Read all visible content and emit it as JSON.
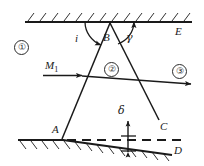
{
  "figure": {
    "width": 204,
    "height": 166,
    "background": "#ffffff",
    "stroke_color": "#1a1a1a",
    "label_color": "#1a1a1a"
  },
  "labels": {
    "region_1": "①",
    "region_2": "②",
    "region_3": "③",
    "point_B": "B",
    "point_A": "A",
    "point_C": "C",
    "point_D": "D",
    "point_E": "E",
    "angle_i": "i",
    "angle_gamma": "γ",
    "offset_delta": "δ",
    "ray_M": "M",
    "ray_M_subscript": "1"
  },
  "geometry": {
    "top_boundary": {
      "x1": 25,
      "y1": 22,
      "x2": 192,
      "y2": 22,
      "hatch_side": "above"
    },
    "bottom_boundary_flat": {
      "x1": 18,
      "y1": 140,
      "x2": 63,
      "y2": 140,
      "hatch_side": "below"
    },
    "bottom_boundary_slanted": {
      "x1": 63,
      "y1": 140,
      "x2": 172,
      "y2": 155,
      "hatch_side": "below"
    },
    "dashed_line": {
      "x1": 66,
      "y1": 140,
      "x2": 186,
      "y2": 140
    },
    "line_AB": {
      "x1": 62,
      "y1": 139,
      "x2": 110,
      "y2": 23
    },
    "line_BC": {
      "x1": 110,
      "y1": 23,
      "x2": 159,
      "y2": 120
    },
    "incident_ray": {
      "x1": 43,
      "y1": 75,
      "x2": 83,
      "y2": 75,
      "arrow": "end"
    },
    "refracted_ray": {
      "x1": 83,
      "y1": 76,
      "x2": 193,
      "y2": 84,
      "arrow": "end"
    },
    "delta_arrow": {
      "x": 128,
      "y1": 120,
      "y2": 152,
      "arrow": "both"
    },
    "arc_i": {
      "cx": 110,
      "cy": 23,
      "r": 26,
      "label_x": 76,
      "label_y": 33
    },
    "arc_gamma": {
      "cx": 110,
      "cy": 23,
      "r": 24,
      "label_x": 126,
      "label_y": 33
    }
  },
  "label_positions": {
    "region_1": {
      "x": 14,
      "y": 40
    },
    "region_2": {
      "x": 104,
      "y": 62
    },
    "region_3": {
      "x": 172,
      "y": 66
    },
    "point_B": {
      "x": 104,
      "y": 33
    },
    "point_A": {
      "x": 52,
      "y": 127
    },
    "point_C": {
      "x": 160,
      "y": 122
    },
    "point_D": {
      "x": 174,
      "y": 148
    },
    "point_E": {
      "x": 175,
      "y": 27
    },
    "angle_i": {
      "x": 75,
      "y": 33
    },
    "angle_gamma": {
      "x": 125,
      "y": 33
    },
    "offset_delta": {
      "x": 117,
      "y": 106
    },
    "ray_M": {
      "x": 45,
      "y": 61
    }
  }
}
